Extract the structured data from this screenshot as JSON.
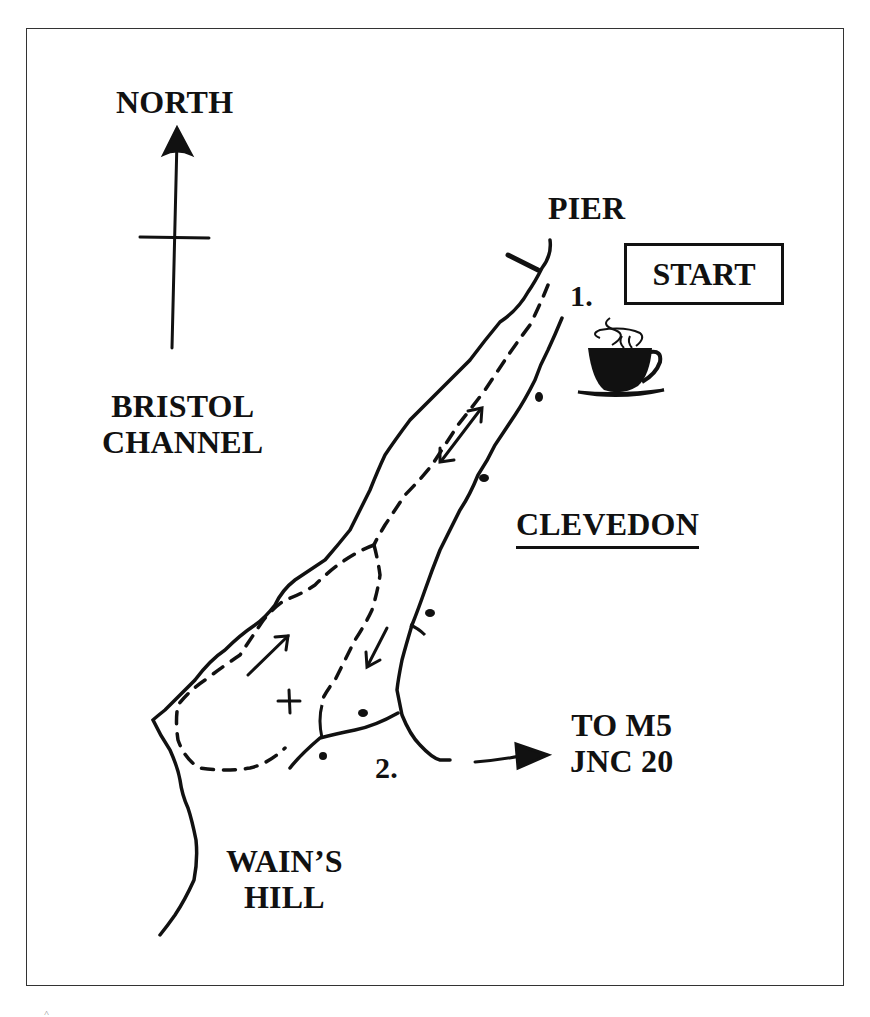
{
  "map": {
    "labels": {
      "north": "NORTH",
      "pier": "PIER",
      "start": "START",
      "waypoint_1": "1.",
      "waypoint_2": "2.",
      "water_line1": "BRISTOL",
      "water_line2": "CHANNEL",
      "town": "CLEVEDON",
      "road_line1": "TO M5",
      "road_line2": "JNC 20",
      "hill_line1": "WAIN’S",
      "hill_line2": "HILL"
    },
    "icons": [
      "north-arrow-icon",
      "cafe-cup-icon",
      "direction-arrow-icon",
      "summit-cross-icon"
    ],
    "colors": {
      "ink": "#111111",
      "background": "#ffffff",
      "frame": "#333333"
    },
    "corner_mark": "˄"
  }
}
